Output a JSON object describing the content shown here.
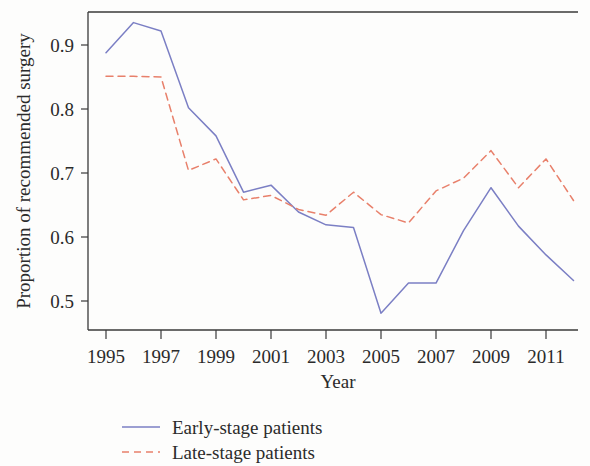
{
  "chart_data": {
    "type": "line",
    "title": "",
    "xlabel": "Year",
    "ylabel": "Proportion of recommended surgery",
    "x": [
      1995,
      1996,
      1997,
      1998,
      1999,
      2000,
      2001,
      2002,
      2003,
      2004,
      2005,
      2006,
      2007,
      2008,
      2009,
      2010,
      2011,
      2012
    ],
    "xlim": [
      1995,
      2012
    ],
    "ylim": [
      0.46,
      0.955
    ],
    "grid": false,
    "legend_position": "below-axes",
    "xticks": [
      1995,
      1997,
      1999,
      2001,
      2003,
      2005,
      2007,
      2009,
      2011
    ],
    "xticklabels": [
      "1995",
      "1997",
      "1999",
      "2001",
      "2003",
      "2005",
      "2007",
      "2009",
      "2011"
    ],
    "yticks": [
      0.5,
      0.6,
      0.7,
      0.8,
      0.9
    ],
    "yticklabels": [
      "0.5",
      "0.6",
      "0.7",
      "0.8",
      "0.9"
    ],
    "series": [
      {
        "name": "Early-stage patients",
        "style": "solid",
        "color": "#7b7fc4",
        "values": [
          0.888,
          0.935,
          0.922,
          0.802,
          0.758,
          0.67,
          0.681,
          0.639,
          0.619,
          0.615,
          0.481,
          0.528,
          0.528,
          0.61,
          0.677,
          0.617,
          0.572,
          0.532
        ]
      },
      {
        "name": "Late-stage patients",
        "style": "dashed",
        "color": "#e8806b",
        "values": [
          0.851,
          0.851,
          0.85,
          0.704,
          0.722,
          0.658,
          0.665,
          0.643,
          0.634,
          0.67,
          0.635,
          0.622,
          0.672,
          0.692,
          0.735,
          0.677,
          0.722,
          0.657
        ]
      }
    ]
  },
  "legend": {
    "entries": [
      {
        "label": "Early-stage patients"
      },
      {
        "label": "Late-stage patients"
      }
    ]
  },
  "colors": {
    "early_stage": "#7b7fc4",
    "late_stage": "#e8806b",
    "axis": "#3a3a3a",
    "text": "#2b2b2b"
  }
}
